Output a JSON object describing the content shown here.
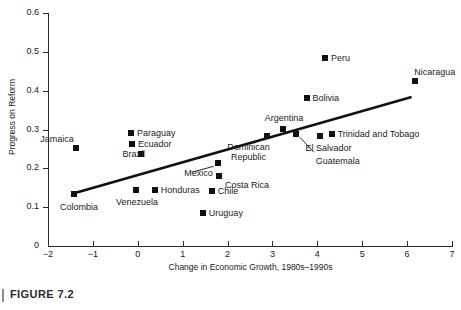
{
  "figure": {
    "caption": "FIGURE 7.2"
  },
  "chart_data": {
    "type": "scatter",
    "title": "",
    "xlabel": "Change in Economic Growth, 1980s–1990s",
    "ylabel": "Progress on Reform",
    "xlim": [
      -2,
      7
    ],
    "ylim": [
      0,
      0.6
    ],
    "grid": false,
    "legend": "none",
    "xticks": [
      "−2",
      "−1",
      "0",
      "1",
      "2",
      "3",
      "4",
      "5",
      "6",
      "7"
    ],
    "xtick_values": [
      -2,
      -1,
      0,
      1,
      2,
      3,
      4,
      5,
      6,
      7
    ],
    "yticks": [
      "0",
      "0.1",
      "0.2",
      "0.3",
      "0.4",
      "0.5",
      "0.6"
    ],
    "ytick_values": [
      0,
      0.1,
      0.2,
      0.3,
      0.4,
      0.5,
      0.6
    ],
    "points": [
      {
        "label": "Jamaica",
        "x": -1.38,
        "y": 0.253,
        "label_dx": -46,
        "label_dy": -14,
        "leader": false
      },
      {
        "label": "Colombia",
        "x": -1.42,
        "y": 0.135,
        "label_dx": -20,
        "label_dy": 8,
        "leader": false
      },
      {
        "label": "Paraguay",
        "x": -0.15,
        "y": 0.292,
        "label_dx": 6,
        "label_dy": -5,
        "leader": false
      },
      {
        "label": "Ecuador",
        "x": -0.13,
        "y": 0.262,
        "label_dx": 6,
        "label_dy": -5,
        "leader": false
      },
      {
        "label": "Brazil",
        "x": 0.07,
        "y": 0.237,
        "label_dx": -40,
        "label_dy": -5,
        "leader": false
      },
      {
        "label": "Venezuela",
        "x": -0.04,
        "y": 0.144,
        "label_dx": -22,
        "label_dy": 7,
        "leader": false
      },
      {
        "label": "Honduras",
        "x": 0.38,
        "y": 0.144,
        "label_dx": 6,
        "label_dy": -5,
        "leader": false
      },
      {
        "label": "Mexico",
        "x": 1.78,
        "y": 0.213,
        "label_dx": -49,
        "label_dy": 5,
        "leader": true,
        "leader_x2": -26,
        "leader_y2": 9
      },
      {
        "label": "Costa Rica",
        "x": 1.81,
        "y": 0.181,
        "label_dx": 6,
        "label_dy": 4,
        "leader": false
      },
      {
        "label": "Chile",
        "x": 1.65,
        "y": 0.141,
        "label_dx": 6,
        "label_dy": -5,
        "leader": false
      },
      {
        "label": "Uruguay",
        "x": 1.45,
        "y": 0.086,
        "label_dx": 6,
        "label_dy": -5,
        "leader": false
      },
      {
        "label": "Dominican Republic",
        "x": 2.87,
        "y": 0.283,
        "label_dx": -18,
        "label_dy": 6,
        "leader": false,
        "two_line": true
      },
      {
        "label": "Argentina",
        "x": 3.24,
        "y": 0.302,
        "label_dx": -24,
        "label_dy": -16,
        "leader": false
      },
      {
        "label": "Bolivia",
        "x": 3.76,
        "y": 0.381,
        "label_dx": 6,
        "label_dy": -5,
        "leader": false
      },
      {
        "label": "Peru",
        "x": 4.17,
        "y": 0.484,
        "label_dx": 6,
        "label_dy": -5,
        "leader": false
      },
      {
        "label": "El Salvador",
        "x": 4.05,
        "y": 0.284,
        "label_dx": -12,
        "label_dy": 7,
        "leader": false
      },
      {
        "label": "Guatemala",
        "x": 3.52,
        "y": 0.288,
        "label_dx": 20,
        "label_dy": 22,
        "leader": true,
        "leader_x2": 18,
        "leader_y2": 18
      },
      {
        "label": "Trinidad and Tobago",
        "x": 4.32,
        "y": 0.289,
        "label_dx": 6,
        "label_dy": -5,
        "leader": false
      },
      {
        "label": "Nicaragua",
        "x": 6.18,
        "y": 0.424,
        "label_dx": -4,
        "label_dy": -14,
        "leader": false
      }
    ],
    "trendline": {
      "x1": -1.42,
      "y1": 0.136,
      "x2": 6.1,
      "y2": 0.384,
      "color": "#111111",
      "width": 2.6
    }
  }
}
